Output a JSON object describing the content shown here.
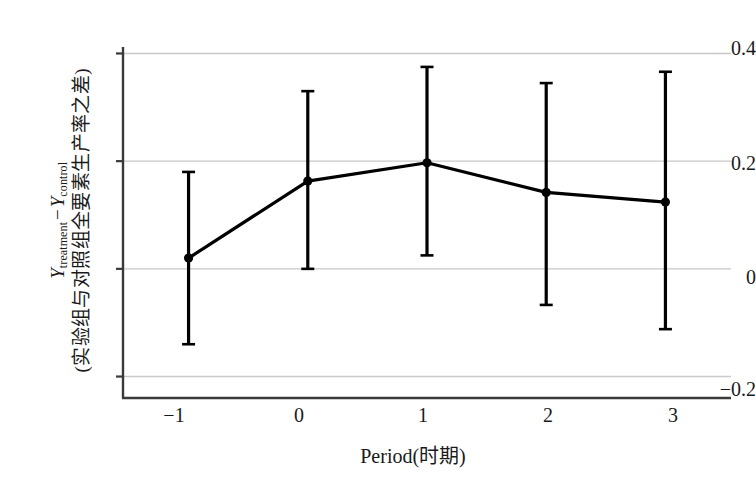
{
  "chart_data": {
    "type": "line",
    "title": "",
    "subtitle": "",
    "xlabel": "Period(时期)",
    "ylabel_line1": "Y treatment − Y control",
    "ylabel_line1_parts": {
      "symbol": "Y",
      "sub1": "treatment",
      "operator": "−",
      "symbol2": "Y",
      "sub2": "control"
    },
    "ylabel_line2": "(实验组与对照组全要素生产率之差)",
    "x": [
      -1,
      0,
      1,
      2,
      3
    ],
    "xtick_labels": [
      "−1",
      "0",
      "1",
      "2",
      "3"
    ],
    "ytick_labels": [
      "0.4",
      "0.2",
      "0",
      "−0.2"
    ],
    "yticks": [
      0.4,
      0.2,
      0,
      -0.2
    ],
    "values": [
      0.02,
      0.163,
      0.197,
      0.142,
      0.124
    ],
    "error_low": [
      -0.14,
      0.0,
      0.025,
      -0.067,
      -0.112
    ],
    "error_high": [
      0.18,
      0.33,
      0.375,
      0.345,
      0.366
    ],
    "xlim": [
      -1.55,
      3.55
    ],
    "ylim": [
      -0.225,
      0.425
    ],
    "grid": true,
    "grid_axis": "y",
    "legend": null,
    "series_name": "treatment-control TFP difference",
    "marker": "circle",
    "line_color": "#000000",
    "grid_color": "#c8c8c8",
    "axis_color": "#3a3a3a",
    "background": "#ffffff"
  }
}
